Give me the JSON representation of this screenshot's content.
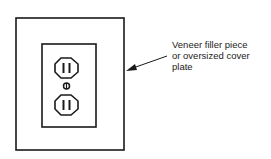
{
  "diagram": {
    "callout": {
      "lines": [
        "Veneer filler piece",
        "or oversized cover",
        "plate"
      ]
    },
    "colors": {
      "stroke": "#1a1a1a",
      "background": "#ffffff"
    }
  }
}
